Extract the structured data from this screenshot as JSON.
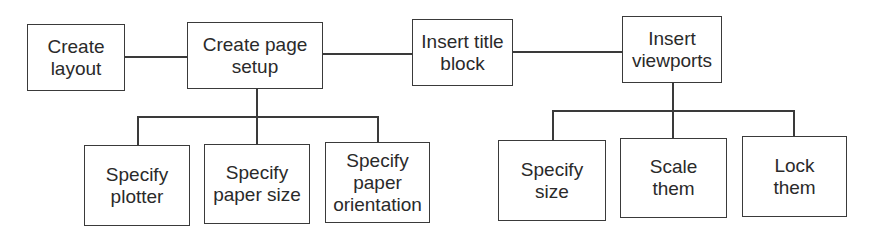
{
  "diagram": {
    "type": "flowchart-tree",
    "main_flow": [
      {
        "id": "create-layout",
        "label": "Create\nlayout"
      },
      {
        "id": "create-page-setup",
        "label": "Create page\nsetup"
      },
      {
        "id": "insert-title-block",
        "label": "Insert title\nblock"
      },
      {
        "id": "insert-viewports",
        "label": "Insert\nviewports"
      }
    ],
    "page_setup_children": [
      {
        "id": "specify-plotter",
        "label": "Specify\nplotter"
      },
      {
        "id": "specify-paper-size",
        "label": "Specify\npaper size"
      },
      {
        "id": "specify-paper-orientation",
        "label": "Specify\npaper\norientation"
      }
    ],
    "viewports_children": [
      {
        "id": "specify-size",
        "label": "Specify\nsize"
      },
      {
        "id": "scale-them",
        "label": "Scale\nthem"
      },
      {
        "id": "lock-them",
        "label": "Lock\nthem"
      }
    ],
    "edges": [
      [
        "create-layout",
        "create-page-setup"
      ],
      [
        "create-page-setup",
        "insert-title-block"
      ],
      [
        "insert-title-block",
        "insert-viewports"
      ],
      [
        "create-page-setup",
        "specify-plotter"
      ],
      [
        "create-page-setup",
        "specify-paper-size"
      ],
      [
        "create-page-setup",
        "specify-paper-orientation"
      ],
      [
        "insert-viewports",
        "specify-size"
      ],
      [
        "insert-viewports",
        "scale-them"
      ],
      [
        "insert-viewports",
        "lock-them"
      ]
    ],
    "colors": {
      "stroke": "#3a3a3a",
      "text": "#2a2a2a",
      "background": "#ffffff"
    }
  }
}
